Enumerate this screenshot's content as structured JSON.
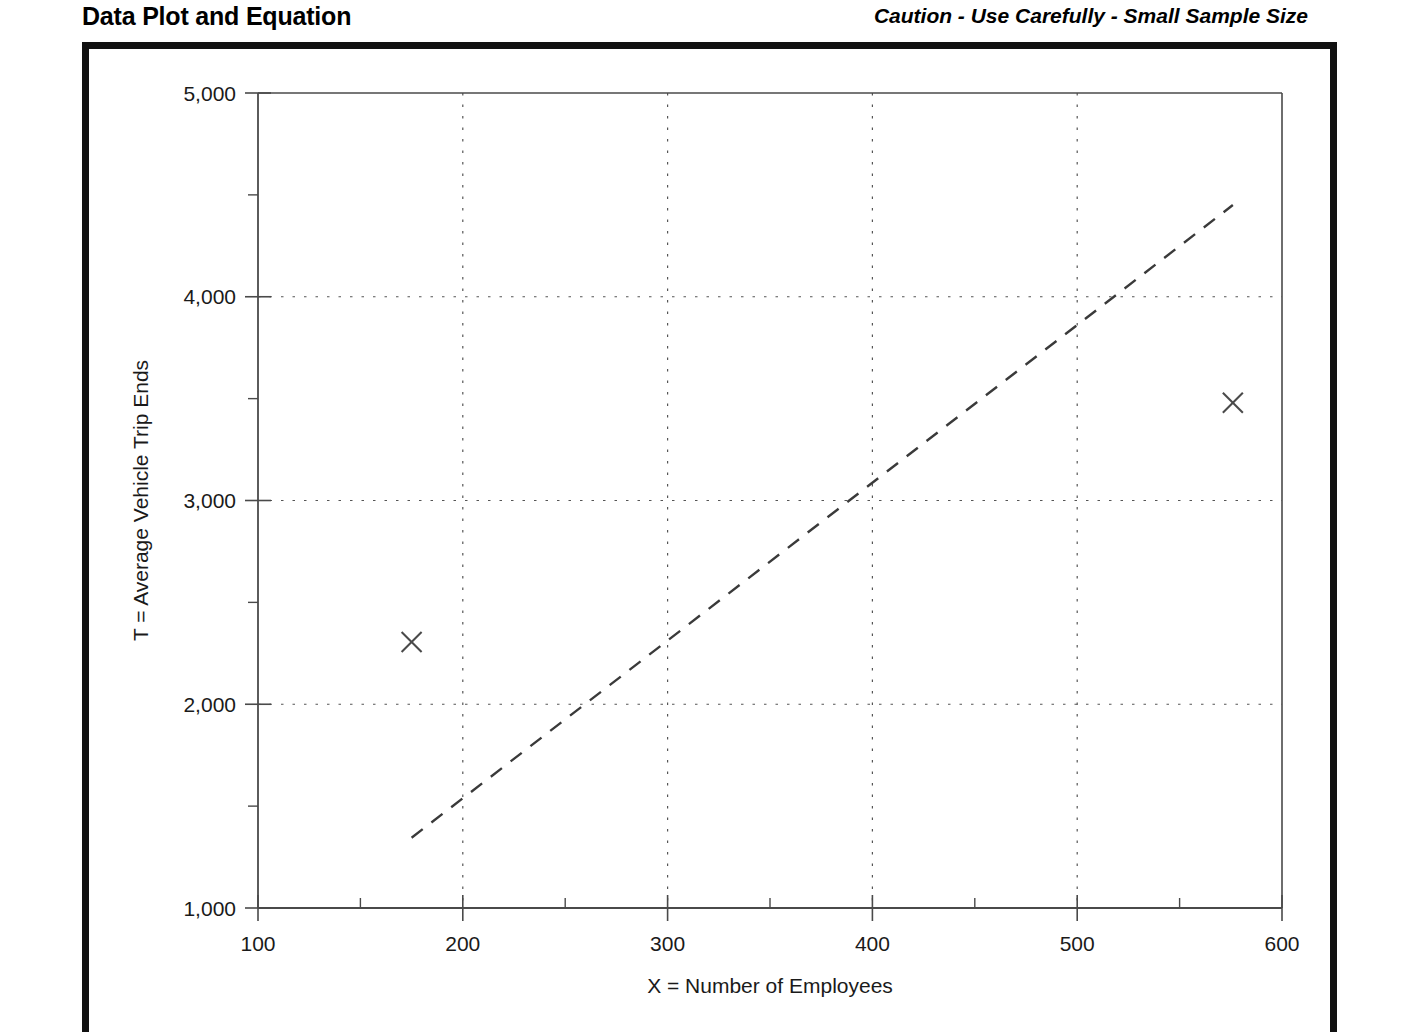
{
  "header": {
    "title": "Data Plot and Equation",
    "caution": "Caution - Use Carefully - Small Sample Size"
  },
  "chart_data": {
    "type": "scatter",
    "title": "Data Plot and Equation",
    "subtitle": "Caution - Use Carefully - Small Sample Size",
    "xlabel": "X = Number of Employees",
    "ylabel": "T = Average Vehicle Trip Ends",
    "xlim": [
      100,
      600
    ],
    "ylim": [
      1000,
      5000
    ],
    "x_major_ticks": [
      100,
      200,
      300,
      400,
      500,
      600
    ],
    "x_tick_labels": [
      "100",
      "200",
      "300",
      "400",
      "500",
      "600"
    ],
    "x_minor_ticks": [
      150,
      250,
      350,
      450,
      550
    ],
    "y_major_ticks": [
      1000,
      2000,
      3000,
      4000,
      5000
    ],
    "y_tick_labels": [
      "1,000",
      "2,000",
      "3,000",
      "4,000",
      "5,000"
    ],
    "y_minor_ticks": [
      1500,
      2500,
      3500,
      4500
    ],
    "grid": "dotted major gridlines on both axes",
    "legend": "none",
    "series": [
      {
        "name": "Data points",
        "type": "scatter",
        "marker": "x",
        "points": [
          {
            "x": 175,
            "y": 2305
          },
          {
            "x": 576,
            "y": 3480
          }
        ]
      },
      {
        "name": "Fitted line",
        "type": "line",
        "style": "dashed",
        "points": [
          {
            "x": 175,
            "y": 1345
          },
          {
            "x": 576,
            "y": 4450
          }
        ]
      }
    ]
  },
  "axes": {
    "x_title": "X = Number of Employees",
    "y_title": "T = Average Vehicle Trip Ends"
  }
}
